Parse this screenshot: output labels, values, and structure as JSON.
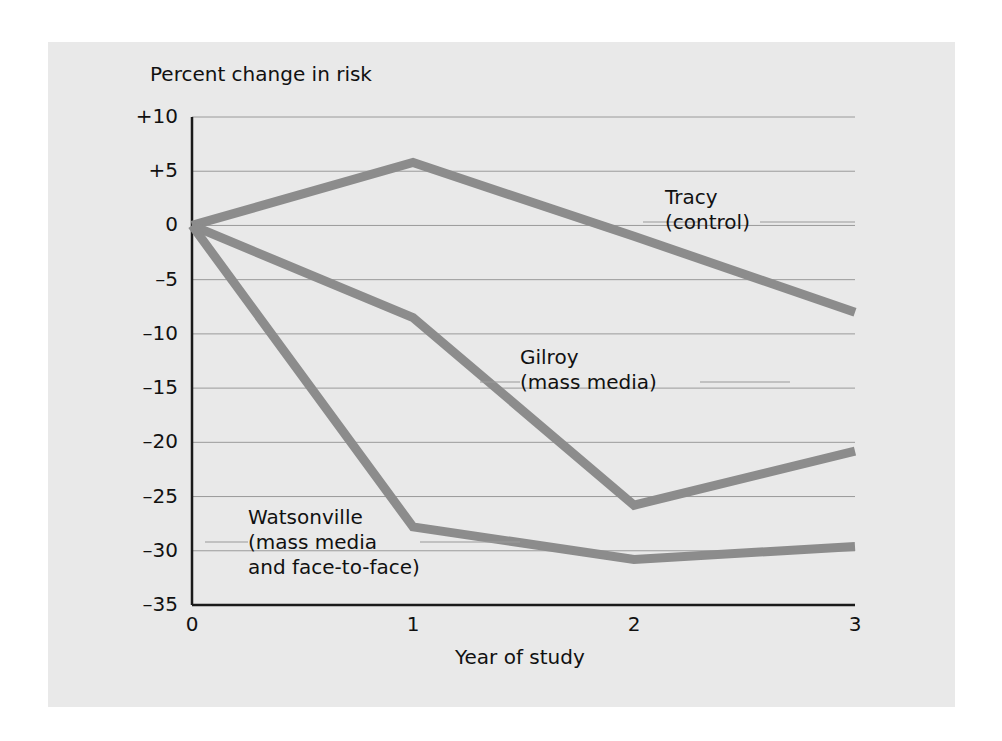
{
  "figure": {
    "background": "#ffffff",
    "panel_background": "#e9e9e9",
    "line_color": "#8c8c8c",
    "axis_color": "#1a1a1a",
    "grid_color": "#9a9a9a"
  },
  "chart_data": {
    "type": "line",
    "title": "",
    "ylabel": "Percent change in risk",
    "xlabel": "Year of study",
    "x": [
      0,
      1,
      2,
      3
    ],
    "xtick_labels": [
      "0",
      "1",
      "2",
      "3"
    ],
    "ytick_labels": [
      "+10",
      "+5",
      "0",
      "–5",
      "–10",
      "–15",
      "–20",
      "–25",
      "–30",
      "–35"
    ],
    "ytick_values": [
      10,
      5,
      0,
      -5,
      -10,
      -15,
      -20,
      -25,
      -30,
      -35
    ],
    "ylim": [
      -35,
      10
    ],
    "xlim": [
      0,
      3
    ],
    "grid": true,
    "legend": "inline-annotations",
    "series": [
      {
        "name": "Tracy (control)",
        "label_lines": [
          "Tracy",
          "(control)"
        ],
        "values": [
          0,
          5.8,
          -1.0,
          -8.0
        ]
      },
      {
        "name": "Gilroy (mass media)",
        "label_lines": [
          "Gilroy",
          "(mass media)"
        ],
        "values": [
          0,
          -8.5,
          -25.8,
          -20.8
        ]
      },
      {
        "name": "Watsonville (mass media and face-to-face)",
        "label_lines": [
          "Watsonville",
          "(mass media",
          "and face-to-face)"
        ],
        "values": [
          0,
          -27.8,
          -30.8,
          -29.6
        ]
      }
    ]
  }
}
